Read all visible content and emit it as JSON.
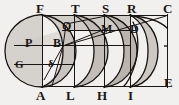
{
  "figure": {
    "background_color": "#f2f0ee",
    "ink_color": "#1a1614",
    "shade_light": "#d6d2cd",
    "shade_mid": "#c4bfba",
    "shade_dark": "#b4aea8",
    "top_labels": [
      {
        "id": "F",
        "text": "F",
        "x": 36,
        "y": 3
      },
      {
        "id": "T",
        "text": "T",
        "x": 72,
        "y": 3
      },
      {
        "id": "S",
        "text": "S",
        "x": 103,
        "y": 3
      },
      {
        "id": "R",
        "text": "R",
        "x": 128,
        "y": 3
      },
      {
        "id": "C",
        "text": "C",
        "x": 163,
        "y": 3
      }
    ],
    "bottom_labels": [
      {
        "id": "A",
        "text": "A",
        "x": 36,
        "y": 88
      },
      {
        "id": "L",
        "text": "L",
        "x": 65,
        "y": 88
      },
      {
        "id": "H",
        "text": "H",
        "x": 93,
        "y": 88
      },
      {
        "id": "I",
        "text": "I",
        "x": 125,
        "y": 88
      },
      {
        "id": "E",
        "text": "E",
        "x": 163,
        "y": 78
      }
    ],
    "interior_labels": [
      {
        "id": "P",
        "text": "P",
        "x": 26,
        "y": 37
      },
      {
        "id": "B",
        "text": "B",
        "x": 55,
        "y": 37
      },
      {
        "id": "Q",
        "text": "Q",
        "x": 63,
        "y": 22
      },
      {
        "id": "M",
        "text": "M",
        "x": 103,
        "y": 25
      },
      {
        "id": "D",
        "text": "D",
        "x": 131,
        "y": 25
      },
      {
        "id": "G",
        "text": "G",
        "x": 16,
        "y": 61
      },
      {
        "id": "delta",
        "text": "δ",
        "x": 48,
        "y": 61
      }
    ],
    "vertical_lines": [
      {
        "id": "FA",
        "x": 42,
        "y1": 15,
        "y2": 86
      },
      {
        "id": "TL",
        "x": 74,
        "y1": 15,
        "y2": 86
      },
      {
        "id": "SH",
        "x": 104,
        "y1": 15,
        "y2": 86
      },
      {
        "id": "RI",
        "x": 130,
        "y1": 15,
        "y2": 86
      },
      {
        "id": "CE",
        "x": 167,
        "y1": 15,
        "y2": 86
      }
    ],
    "horizontal_lines": [
      {
        "id": "top-FC",
        "y": 15,
        "x1": 42,
        "x2": 167
      },
      {
        "id": "bottom-AE",
        "y": 86,
        "x1": 42,
        "x2": 167
      },
      {
        "id": "mid-B",
        "y": 45,
        "x1": 14,
        "x2": 130
      },
      {
        "id": "upper-QD",
        "y": 30,
        "x1": 62,
        "x2": 135
      },
      {
        "id": "lower-G",
        "y": 64,
        "x1": 14,
        "x2": 74
      }
    ]
  }
}
